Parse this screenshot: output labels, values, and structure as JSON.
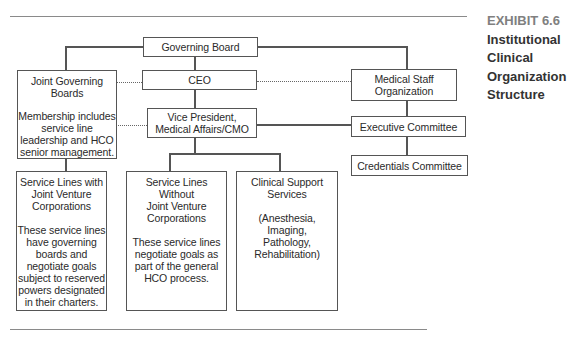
{
  "exhibit": {
    "number": "EXHIBIT 6.6",
    "title_lines": [
      "Institutional",
      "Clinical",
      "Organization",
      "Structure"
    ]
  },
  "nodes": {
    "governing_board": {
      "label": "Governing Board"
    },
    "ceo": {
      "label": "CEO"
    },
    "vp": {
      "lines": [
        "Vice President,",
        "Medical Affairs/CMO"
      ]
    },
    "joint_governing_boards": {
      "title": [
        "Joint Governing",
        "Boards"
      ],
      "body": [
        "Membership includes",
        "service line",
        "leadership and HCO",
        "senior management."
      ]
    },
    "medical_staff": {
      "lines": [
        "Medical Staff",
        "Organization"
      ]
    },
    "executive_committee": {
      "label": "Executive Committee"
    },
    "credentials_committee": {
      "label": "Credentials Committee"
    },
    "service_lines_with_jv": {
      "title": [
        "Service Lines with",
        "Joint Venture",
        "Corporations"
      ],
      "body": [
        "These service lines",
        "have governing",
        "boards and",
        "negotiate goals",
        "subject to reserved",
        "powers designated",
        "in their charters."
      ]
    },
    "service_lines_without_jv": {
      "title": [
        "Service Lines",
        "Without",
        "Joint Venture",
        "Corporations"
      ],
      "body": [
        "These service lines",
        "negotiate goals as",
        "part of the general",
        "HCO process."
      ]
    },
    "clinical_support": {
      "title": [
        "Clinical Support",
        "Services"
      ],
      "body": [
        "(Anesthesia,",
        "Imaging,",
        "Pathology,",
        "Rehabilitation)"
      ]
    }
  },
  "edges": [
    {
      "from": "governing_board",
      "to": "ceo",
      "style": "solid"
    },
    {
      "from": "ceo",
      "to": "vp",
      "style": "solid"
    },
    {
      "from": "governing_board",
      "to": "joint_governing_boards",
      "style": "solid"
    },
    {
      "from": "governing_board",
      "to": "medical_staff",
      "style": "solid"
    },
    {
      "from": "ceo",
      "to": "joint_governing_boards",
      "style": "dotted"
    },
    {
      "from": "ceo",
      "to": "medical_staff",
      "style": "dotted"
    },
    {
      "from": "vp",
      "to": "joint_governing_boards",
      "style": "dotted"
    },
    {
      "from": "vp",
      "to": "executive_committee",
      "style": "solid"
    },
    {
      "from": "medical_staff",
      "to": "executive_committee",
      "style": "solid"
    },
    {
      "from": "executive_committee",
      "to": "credentials_committee",
      "style": "solid"
    },
    {
      "from": "joint_governing_boards",
      "to": "service_lines_with_jv",
      "style": "solid"
    },
    {
      "from": "vp",
      "to": "service_lines_without_jv",
      "style": "solid"
    },
    {
      "from": "vp",
      "to": "clinical_support",
      "style": "solid"
    }
  ]
}
